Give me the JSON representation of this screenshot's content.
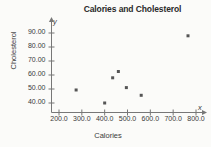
{
  "chart_data": {
    "type": "scatter",
    "title": "Calories and Cholesterol",
    "xlabel": "Calories",
    "ylabel": "Cholesterol",
    "xlim": [
      160,
      830
    ],
    "ylim": [
      36,
      95
    ],
    "grid": false,
    "legend": null,
    "axis_symbols": {
      "x": "x",
      "y": "y"
    },
    "xticks": [
      200.0,
      300.0,
      400.0,
      500.0,
      600.0,
      700.0,
      800.0
    ],
    "xtick_labels": [
      "200.0",
      "300.0",
      "400.0",
      "500.0",
      "600.0",
      "700.0",
      "800.0"
    ],
    "yticks": [
      40.0,
      50.0,
      60.0,
      70.0,
      80.0,
      90.0
    ],
    "ytick_labels": [
      "40.00",
      "50.00",
      "60.00",
      "70.00",
      "80.00",
      "90.00"
    ],
    "marker_color": "#555555",
    "axis_color": "#777777",
    "points": [
      {
        "x": 275,
        "y": 49.3
      },
      {
        "x": 400,
        "y": 40.0
      },
      {
        "x": 435,
        "y": 58.0
      },
      {
        "x": 460,
        "y": 62.5
      },
      {
        "x": 495,
        "y": 51.0
      },
      {
        "x": 560,
        "y": 45.5
      },
      {
        "x": 765,
        "y": 88.0
      }
    ],
    "series_name": "Cholesterol vs Calories"
  }
}
